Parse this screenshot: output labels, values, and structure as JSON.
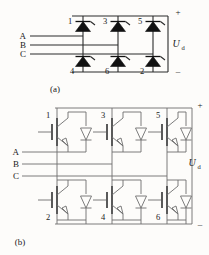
{
  "figure": {
    "background_color": "#fdfcfa",
    "line_color": "#2b2b2b"
  },
  "panel_a": {
    "caption": "(a)",
    "description": "Three-phase thyristor bridge rectifier",
    "device_type": "thyristor",
    "upper_devices": [
      "1",
      "3",
      "5"
    ],
    "lower_devices": [
      "4",
      "6",
      "2"
    ],
    "phase_labels": [
      "A",
      "B",
      "C"
    ],
    "output_label": "U",
    "output_subscript": "d",
    "terminal_positive": "+",
    "terminal_negative": "–"
  },
  "panel_b": {
    "caption": "(b)",
    "description": "Three-phase IGBT bridge inverter with anti-parallel diodes",
    "device_type": "igbt-with-antiparallel-diode",
    "upper_devices": [
      "1",
      "3",
      "5"
    ],
    "lower_devices": [
      "2",
      "4",
      "6"
    ],
    "phase_labels": [
      "A",
      "B",
      "C"
    ],
    "output_label": "U",
    "output_subscript": "d",
    "terminal_positive": "+",
    "terminal_negative": "–"
  }
}
